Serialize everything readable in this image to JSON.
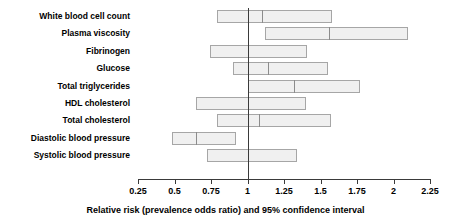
{
  "chart_data": {
    "type": "bar",
    "title": "",
    "subtitle": "",
    "xlabel": "Relative risk (prevalence odds ratio) and 95% confidence interval",
    "ylabel": "",
    "xlim": [
      0.25,
      2.25
    ],
    "xticks": [
      "0.25",
      "0.5",
      "0.75",
      "1",
      "1.25",
      "1.5",
      "1.75",
      "2",
      "2.25"
    ],
    "xtick_values": [
      0.25,
      0.5,
      0.75,
      1,
      1.25,
      1.5,
      1.75,
      2,
      2.25
    ],
    "grid": false,
    "legend": "none",
    "reference_line": 1,
    "categories": [
      "White blood cell count",
      "Plasma viscosity",
      "Fibrinogen",
      "Glucose",
      "Total triglycerides",
      "HDL cholesterol",
      "Total cholesterol",
      "Diastolic blood pressure",
      "Systolic blood pressure"
    ],
    "series": [
      {
        "name": "Relative risk (prevalence odds ratio) with 95% confidence interval",
        "points": [
          {
            "label": "White blood cell count",
            "ci_low": 0.79,
            "estimate": 1.1,
            "ci_high": 1.58
          },
          {
            "label": "Plasma viscosity",
            "ci_low": 1.12,
            "estimate": 1.56,
            "ci_high": 2.1
          },
          {
            "label": "Fibrinogen",
            "ci_low": 0.74,
            "estimate": 1.0,
            "ci_high": 1.41
          },
          {
            "label": "Glucose",
            "ci_low": 0.9,
            "estimate": 1.14,
            "ci_high": 1.55
          },
          {
            "label": "Total triglycerides",
            "ci_low": 1.0,
            "estimate": 1.32,
            "ci_high": 1.77
          },
          {
            "label": "HDL cholesterol",
            "ci_low": 0.65,
            "estimate": 1.0,
            "ci_high": 1.4
          },
          {
            "label": "Total cholesterol",
            "ci_low": 0.79,
            "estimate": 1.08,
            "ci_high": 1.57
          },
          {
            "label": "Diastolic blood pressure",
            "ci_low": 0.48,
            "estimate": 0.65,
            "ci_high": 0.92
          },
          {
            "label": "Systolic blood pressure",
            "ci_low": 0.72,
            "estimate": 1.0,
            "ci_high": 1.34
          }
        ]
      }
    ],
    "colors": {
      "bar_fill": "#f0f0f0",
      "bar_border": "#a6a6a6",
      "divider": "#8c8c8c",
      "axis": "#3a3a3a",
      "reference_line": "#3a3a3a",
      "text": "#000000",
      "background": "#ffffff"
    }
  }
}
